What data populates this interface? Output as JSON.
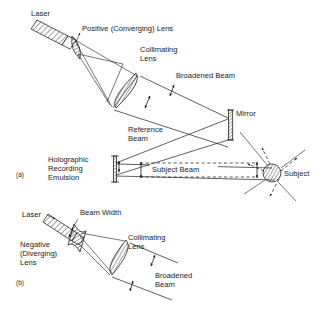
{
  "figure": {
    "background_color": "#ffffff",
    "ink_color": "#1a1a1a"
  },
  "panels": [
    {
      "id": "a",
      "caption": "(a)",
      "description": "Holographic recording arrangement using a positive (converging) lens beam expander",
      "labels": {
        "laser": "Laser",
        "positive_lens": "Positive (Converging) Lens",
        "collimating_lens_line1": "Collimating",
        "collimating_lens_line2": "Lens",
        "broadened_beam": "Broadened Beam",
        "mirror": "Mirror",
        "reference_beam_line1": "Reference",
        "reference_beam_line2": "Beam",
        "emulsion_line1": "Holographic",
        "emulsion_line2": "Recording",
        "emulsion_line3": "Emulsion",
        "subject_beam": "Subject Beam",
        "subject": "Subject"
      }
    },
    {
      "id": "b",
      "caption": "(b)",
      "description": "Beam expander arrangement using a negative (diverging) lens",
      "labels": {
        "laser": "Laser",
        "beam_width": "Beam Width",
        "negative_lens_line1": "Negative",
        "negative_lens_line2": "(Diverging)",
        "negative_lens_line3": "Lens",
        "collimating_lens_line1": "Collimating",
        "collimating_lens_line2": "Lens",
        "broadened_beam_line1": "Broadened",
        "broadened_beam_line2": "Beam"
      }
    }
  ]
}
